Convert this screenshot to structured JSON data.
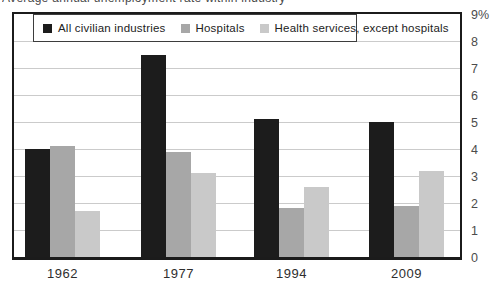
{
  "title": "Average annual unemployment rate within industry",
  "legend": {
    "items": [
      {
        "label": "All civilian industries",
        "color": "#1c1c1c"
      },
      {
        "label": "Hospitals",
        "color": "#a7a7a7"
      },
      {
        "label": "Health services, except hospitals",
        "color": "#c9c9c9"
      }
    ]
  },
  "y_axis": {
    "tick_labels": [
      "9%",
      "8",
      "7",
      "6",
      "5",
      "4",
      "3",
      "2",
      "1",
      "0"
    ]
  },
  "chart_data": {
    "type": "bar",
    "categories": [
      "1962",
      "1977",
      "1994",
      "2009"
    ],
    "series": [
      {
        "name": "All civilian industries",
        "color": "#1c1c1c",
        "values": [
          4.0,
          7.5,
          5.1,
          5.0
        ]
      },
      {
        "name": "Hospitals",
        "color": "#a7a7a7",
        "values": [
          4.1,
          3.9,
          1.8,
          1.9
        ]
      },
      {
        "name": "Health services, except hospitals",
        "color": "#c9c9c9",
        "values": [
          1.7,
          3.1,
          2.6,
          3.2
        ]
      }
    ],
    "title": "Average annual unemployment rate within industry",
    "xlabel": "",
    "ylabel": "",
    "ylim": [
      0,
      9
    ],
    "grid": true,
    "legend_position": "top-left"
  }
}
